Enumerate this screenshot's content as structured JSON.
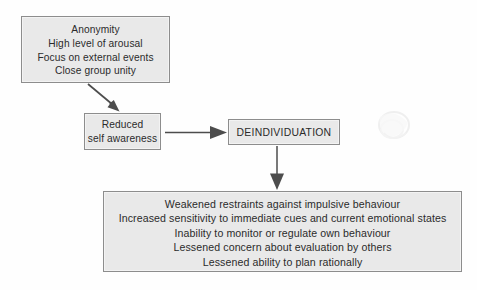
{
  "diagram": {
    "colors": {
      "box_fill": "#e9e9e9",
      "box_border": "#8d8d8d",
      "text": "#2b2b2b",
      "arrow": "#4d4d4d",
      "background": "#fefefe"
    },
    "nodes": {
      "antecedents": {
        "name": "antecedent-conditions",
        "lines": [
          "Anonymity",
          "High level of arousal",
          "Focus on external events",
          "Close group unity"
        ]
      },
      "reduced_self_awareness": {
        "name": "reduced-self-awareness",
        "lines": [
          "Reduced",
          "self awareness"
        ]
      },
      "deindividuation": {
        "name": "deindividuation",
        "lines": [
          "DEINDIVIDUATION"
        ]
      },
      "consequences": {
        "name": "behavioural-consequences",
        "lines": [
          "Weakened restraints against impulsive behaviour",
          "Increased sensitivity to immediate cues and current emotional states",
          "Inability to monitor or regulate own behaviour",
          "Lessened concern about evaluation by others",
          "Lessened ability to plan rationally"
        ]
      }
    },
    "connectors": [
      {
        "name": "arrow-antecedents-to-reduced",
        "from": "antecedents",
        "to": "reduced_self_awareness",
        "direction": "diagonal-down-right"
      },
      {
        "name": "arrow-reduced-to-deindividuation",
        "from": "reduced_self_awareness",
        "to": "deindividuation",
        "direction": "right"
      },
      {
        "name": "arrow-deindividuation-to-consequences",
        "from": "deindividuation",
        "to": "consequences",
        "direction": "down"
      }
    ]
  }
}
